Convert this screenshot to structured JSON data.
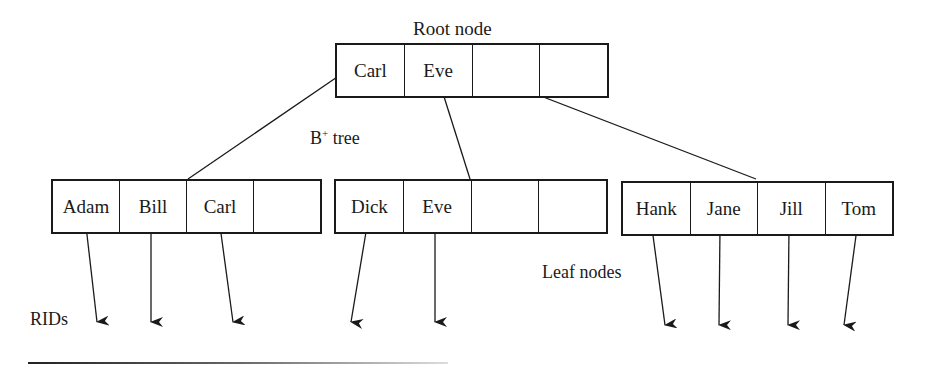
{
  "diagram": {
    "title": "B+ tree",
    "title_base": "B",
    "title_sup": "+",
    "title_rest": " tree",
    "root_label": "Root node",
    "leaf_label": "Leaf nodes",
    "rids_label": "RIDs",
    "root": {
      "cells": [
        "Carl",
        "Eve",
        "",
        ""
      ]
    },
    "leaves": [
      {
        "cells": [
          "Adam",
          "Bill",
          "Carl",
          ""
        ]
      },
      {
        "cells": [
          "Dick",
          "Eve",
          "",
          ""
        ]
      },
      {
        "cells": [
          "Hank",
          "Jane",
          "Jill",
          "Tom"
        ]
      }
    ],
    "edges": [
      {
        "from": "root.Carl",
        "to": "leaf1"
      },
      {
        "from": "root.Eve",
        "to": "leaf2"
      },
      {
        "from": "root.cell3",
        "to": "leaf3"
      }
    ],
    "rid_pointers": [
      "Adam",
      "Bill",
      "Carl",
      "Dick",
      "Eve",
      "Hank",
      "Jane",
      "Jill",
      "Tom"
    ]
  }
}
